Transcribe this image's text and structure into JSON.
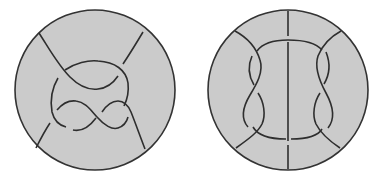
{
  "figure": {
    "colors": {
      "disk_fill": "#cbcbcb",
      "stroke": "#2e2e2e",
      "background": "#ffffff"
    },
    "panels": [
      {
        "id": "left-tangle",
        "name": "Left disk with clasp-and-figure-eight tangle",
        "center": [
          95,
          90
        ],
        "radius": 80
      },
      {
        "id": "right-tangle",
        "name": "Right disk with two twisted loops and vertical strand",
        "center": [
          288,
          90
        ],
        "radius": 80
      }
    ]
  }
}
